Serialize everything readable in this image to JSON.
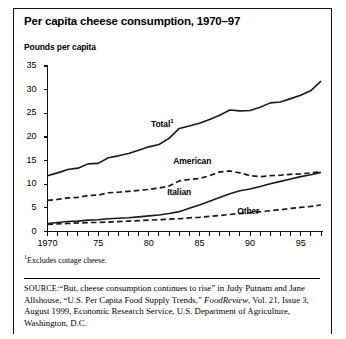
{
  "figure": {
    "title": "Per capita cheese consumption, 1970–97",
    "axis_subtitle": "Pounds per capita",
    "footnote_marker": "1",
    "footnote_text": "Excludes cottage cheese.",
    "source_tag": "SOURCE:",
    "source_part1": "“But, cheese consumption continues to rise” in Judy Putnam and Jane Allshouse, “U.S. Per Capita Food Supply Trends,” ",
    "source_italic": "FoodReview",
    "source_part2": ", Vol. 21, Issue 3, August 1999, Economic Research Service, U.S. Department of Agriculture, Washington, D.C."
  },
  "chart_data": {
    "type": "line",
    "title": "Per capita cheese consumption, 1970–97",
    "xlabel": "",
    "ylabel": "Pounds per capita",
    "xlim": [
      1970,
      1997
    ],
    "ylim": [
      0,
      35
    ],
    "yticks": [
      0,
      5,
      10,
      15,
      20,
      25,
      30,
      35
    ],
    "ytick_labels": [
      "0",
      "5",
      "10",
      "15",
      "20",
      "25",
      "30",
      "35"
    ],
    "xticks": [
      1970,
      1975,
      1980,
      1985,
      1990,
      1995
    ],
    "xtick_labels": [
      "1970",
      "75",
      "80",
      "85",
      "90",
      "95"
    ],
    "minor_xticks_every": 1,
    "grid": false,
    "legend": "inline-labels",
    "x": [
      1970,
      1971,
      1972,
      1973,
      1974,
      1975,
      1976,
      1977,
      1978,
      1979,
      1980,
      1981,
      1982,
      1983,
      1984,
      1985,
      1986,
      1987,
      1988,
      1989,
      1990,
      1991,
      1992,
      1993,
      1994,
      1995,
      1996,
      1997
    ],
    "series": [
      {
        "name": "Total",
        "label": "Total",
        "label_superscript": "1",
        "style": "solid",
        "color": "#1a1a1a",
        "values": [
          11.8,
          12.4,
          13.1,
          13.4,
          14.3,
          14.4,
          15.6,
          16.0,
          16.5,
          17.2,
          17.9,
          18.4,
          19.7,
          21.8,
          22.3,
          22.9,
          23.7,
          24.6,
          25.7,
          25.5,
          25.6,
          26.3,
          27.2,
          27.4,
          28.1,
          28.8,
          29.8,
          31.8
        ]
      },
      {
        "name": "American",
        "label": "American",
        "style": "dashed",
        "color": "#1a1a1a",
        "values": [
          6.6,
          6.8,
          7.1,
          7.2,
          7.6,
          7.7,
          8.2,
          8.3,
          8.5,
          8.7,
          8.9,
          9.2,
          9.6,
          10.7,
          11.0,
          11.2,
          11.8,
          12.6,
          12.8,
          12.4,
          11.8,
          11.6,
          11.8,
          11.9,
          12.1,
          12.2,
          12.4,
          12.6
        ]
      },
      {
        "name": "Italian",
        "label": "Italian",
        "style": "solid",
        "color": "#1a1a1a",
        "values": [
          1.7,
          1.9,
          2.1,
          2.2,
          2.4,
          2.5,
          2.7,
          2.8,
          2.9,
          3.1,
          3.3,
          3.5,
          3.8,
          4.2,
          4.9,
          5.6,
          6.4,
          7.2,
          8.0,
          8.6,
          9.0,
          9.5,
          10.1,
          10.6,
          11.1,
          11.6,
          12.0,
          12.5
        ]
      },
      {
        "name": "Other",
        "label": "Other",
        "style": "dashed",
        "color": "#1a1a1a",
        "values": [
          1.5,
          1.6,
          1.7,
          1.8,
          1.9,
          1.9,
          2.0,
          2.1,
          2.2,
          2.3,
          2.4,
          2.5,
          2.6,
          2.7,
          2.9,
          3.0,
          3.2,
          3.4,
          3.6,
          3.8,
          4.0,
          4.2,
          4.4,
          4.6,
          4.9,
          5.1,
          5.3,
          5.6
        ]
      }
    ],
    "annotations": [
      {
        "text": "Total",
        "superscript": "1",
        "x": 1982.0,
        "y": 22.6
      },
      {
        "text": "American",
        "x": 1984.2,
        "y": 14.6
      },
      {
        "text": "Italian",
        "x": 1983.6,
        "y": 8.2
      },
      {
        "text": "Other",
        "x": 1990.5,
        "y": 4.2
      }
    ]
  }
}
